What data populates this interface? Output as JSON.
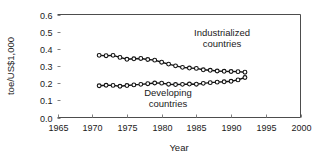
{
  "chart_data": {
    "type": "line",
    "title": "",
    "xlabel": "Year",
    "ylabel": "toe/US$1,000",
    "xlim": [
      1965,
      2000
    ],
    "ylim": [
      0.0,
      0.6
    ],
    "xticks": [
      1965,
      1970,
      1975,
      1980,
      1985,
      1990,
      1995,
      2000
    ],
    "xtick_labels": [
      "1965",
      "1970",
      "1975",
      "1980",
      "1985",
      "1990",
      "1995",
      "2000"
    ],
    "yticks": [
      0.0,
      0.1,
      0.2,
      0.3,
      0.4,
      0.5,
      0.6
    ],
    "ytick_labels": [
      "0.0",
      "0.1",
      "0.2",
      "0.3",
      "0.4",
      "0.5",
      "0.6"
    ],
    "grid": false,
    "legend_position": "inline-annotation",
    "marker": "circle-open",
    "x": [
      1971,
      1972,
      1973,
      1974,
      1975,
      1976,
      1977,
      1978,
      1979,
      1980,
      1981,
      1982,
      1983,
      1984,
      1985,
      1986,
      1987,
      1988,
      1989,
      1990,
      1991,
      1992
    ],
    "series": [
      {
        "name": "Industrialized countries",
        "label_line1": "Industrialized",
        "label_line2": "countries",
        "values": [
          0.362,
          0.36,
          0.362,
          0.35,
          0.339,
          0.342,
          0.344,
          0.338,
          0.334,
          0.322,
          0.311,
          0.301,
          0.292,
          0.288,
          0.286,
          0.278,
          0.275,
          0.271,
          0.269,
          0.268,
          0.267,
          0.264
        ]
      },
      {
        "name": "Developing countries",
        "label_line1": "Developing",
        "label_line2": "countries",
        "values": [
          0.185,
          0.188,
          0.187,
          0.182,
          0.186,
          0.19,
          0.193,
          0.197,
          0.201,
          0.2,
          0.194,
          0.192,
          0.193,
          0.195,
          0.194,
          0.199,
          0.203,
          0.206,
          0.208,
          0.211,
          0.219,
          0.233
        ]
      }
    ]
  },
  "colors": {
    "line": "#111111",
    "marker_fill": "#ffffff",
    "frame": "#4d4d4d",
    "text": "#1a1a1a",
    "background": "#ffffff"
  }
}
